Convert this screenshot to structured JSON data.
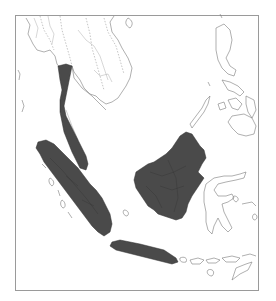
{
  "map": {
    "title": "",
    "colors": {
      "background": "#ffffff",
      "frame": "#9a9a9a",
      "shaded_land": "#4a4a4a",
      "outline_land": "#7a7a7a"
    },
    "shaded_regions": [
      "malay-peninsula",
      "sumatra",
      "borneo",
      "java"
    ],
    "outlined_regions": [
      "indochina",
      "philippines",
      "sulawesi",
      "lesser-sunda-islands",
      "mentawai-islands",
      "palawan"
    ]
  }
}
